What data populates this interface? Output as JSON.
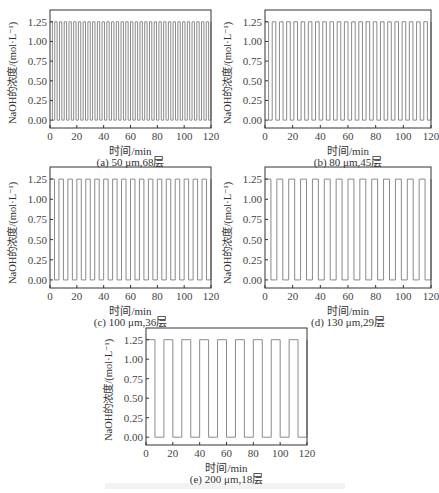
{
  "figure": {
    "ylabel": "NaOH的浓度/(mol·L⁻¹)",
    "xlabel": "时间/min",
    "y_ticks": [
      "0.00",
      "0.25",
      "0.50",
      "0.75",
      "1.00",
      "1.25"
    ],
    "x_ticks": [
      "0",
      "20",
      "40",
      "60",
      "80",
      "100",
      "120"
    ],
    "line_color": "#8a8a8a",
    "axis_color": "#333333"
  },
  "chart_data": [
    {
      "type": "line",
      "title": "(a) 50 μm,68层",
      "caption": "(a) 50 μm,68层",
      "xlabel": "时间/min",
      "ylabel": "NaOH的浓度/(mol·L⁻¹)",
      "xlim": [
        0,
        120
      ],
      "ylim": [
        -0.1,
        1.4
      ],
      "signal": "square wave",
      "high": 1.25,
      "low": 0.0,
      "cycles": 34,
      "period_min": 3.53,
      "layers": 68,
      "thickness_um": 50
    },
    {
      "type": "line",
      "title": "(b) 80 μm,45层",
      "caption": "(b) 80 μm,45层",
      "xlabel": "时间/min",
      "ylabel": "NaOH的浓度/(mol·L⁻¹)",
      "xlim": [
        0,
        120
      ],
      "ylim": [
        -0.1,
        1.4
      ],
      "signal": "square wave",
      "high": 1.25,
      "low": 0.0,
      "cycles": 23,
      "period_min": 5.33,
      "layers": 45,
      "thickness_um": 80
    },
    {
      "type": "line",
      "title": "(c) 100 μm,36层",
      "caption": "(c) 100 μm,36层",
      "xlabel": "时间/min",
      "ylabel": "NaOH的浓度/(mol·L⁻¹)",
      "xlim": [
        0,
        120
      ],
      "ylim": [
        -0.1,
        1.4
      ],
      "signal": "square wave",
      "high": 1.25,
      "low": 0.0,
      "cycles": 18,
      "period_min": 6.67,
      "layers": 36,
      "thickness_um": 100
    },
    {
      "type": "line",
      "title": "(d) 130 μm,29层",
      "caption": "(d) 130 μm,29层",
      "xlabel": "时间/min",
      "ylabel": "NaOH的浓度/(mol·L⁻¹)",
      "xlim": [
        0,
        120
      ],
      "ylim": [
        -0.1,
        1.4
      ],
      "signal": "square wave",
      "high": 1.25,
      "low": 0.0,
      "cycles": 14,
      "period_min": 8.28,
      "layers": 29,
      "thickness_um": 130
    },
    {
      "type": "line",
      "title": "(e) 200 μm,18层",
      "caption": "(e) 200 μm,18层",
      "xlabel": "时间/min",
      "ylabel": "NaOH的浓度/(mol·L⁻¹)",
      "xlim": [
        0,
        120
      ],
      "ylim": [
        -0.1,
        1.4
      ],
      "signal": "square wave",
      "high": 1.25,
      "low": 0.0,
      "cycles": 9,
      "period_min": 13.33,
      "layers": 18,
      "thickness_um": 200
    }
  ]
}
